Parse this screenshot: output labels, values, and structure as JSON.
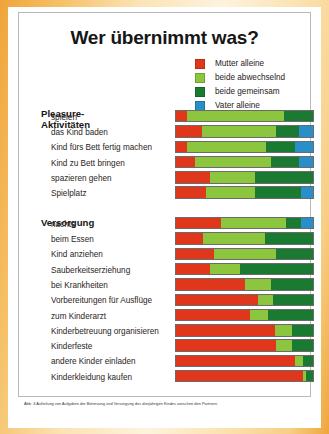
{
  "figure": {
    "title": "Wer übernimmt was?",
    "caption": "Abb. 4 Aufteilung von Aufgaben der Betreuung und Versorgung des dreijährigen Kindes zwischen den Partnern"
  },
  "legend": {
    "items": [
      {
        "label": "Mutter alleine",
        "color": "#e0361c"
      },
      {
        "label": "beide abwechselnd",
        "color": "#8cc63e"
      },
      {
        "label": "beide gemeinsam",
        "color": "#1a7a32"
      },
      {
        "label": "Vater alleine",
        "color": "#2a8ec9"
      }
    ]
  },
  "sections": [
    {
      "heading": "Pleasure-\nAktivitäten",
      "heading_line1": "Pleasure-",
      "heading_line2": "Aktivitäten"
    },
    {
      "heading": "Versorgung"
    }
  ],
  "chart_data": {
    "type": "bar",
    "orientation": "horizontal",
    "stacked": true,
    "normalized": true,
    "title": "Wer übernimmt was?",
    "xlabel": "",
    "ylabel": "",
    "xlim": [
      0,
      100
    ],
    "grid": false,
    "legend_position": "top-right",
    "series": [
      {
        "name": "Mutter alleine",
        "color": "#e0361c"
      },
      {
        "name": "beide abwechselnd",
        "color": "#8cc63e"
      },
      {
        "name": "beide gemeinsam",
        "color": "#1a7a32"
      },
      {
        "name": "Vater alleine",
        "color": "#2a8ec9"
      }
    ],
    "groups": [
      {
        "name": "Pleasure-Aktivitäten",
        "categories": [
          "spielen",
          "das Kind baden",
          "Kind fürs Bett fertig machen",
          "Kind zu Bett bringen",
          "spazieren gehen",
          "Spielplatz"
        ],
        "values": [
          [
            8,
            71,
            21,
            0
          ],
          [
            19,
            54,
            17,
            10
          ],
          [
            8,
            58,
            21,
            13
          ],
          [
            14,
            55,
            21,
            10
          ],
          [
            25,
            33,
            42,
            0
          ],
          [
            22,
            36,
            33,
            9
          ]
        ]
      },
      {
        "name": "Versorgung",
        "categories": [
          "nachts",
          "beim Essen",
          "Kind anziehen",
          "Sauberkeitserziehung",
          "bei Krankheiten",
          "Vorbereitungen für Ausflüge",
          "zum Kinderarzt",
          "Kinderbetreuung organisieren",
          "Kinderfeste",
          "andere Kinder einladen",
          "Kinderkleidung kaufen"
        ],
        "values": [
          [
            33,
            47,
            11,
            9
          ],
          [
            20,
            45,
            35,
            0
          ],
          [
            28,
            45,
            27,
            0
          ],
          [
            25,
            22,
            53,
            0
          ],
          [
            50,
            19,
            31,
            0
          ],
          [
            60,
            11,
            29,
            0
          ],
          [
            54,
            13,
            33,
            0
          ],
          [
            72,
            13,
            15,
            0
          ],
          [
            73,
            12,
            15,
            0
          ],
          [
            87,
            6,
            7,
            0
          ],
          [
            93,
            2,
            5,
            0
          ]
        ]
      }
    ]
  }
}
